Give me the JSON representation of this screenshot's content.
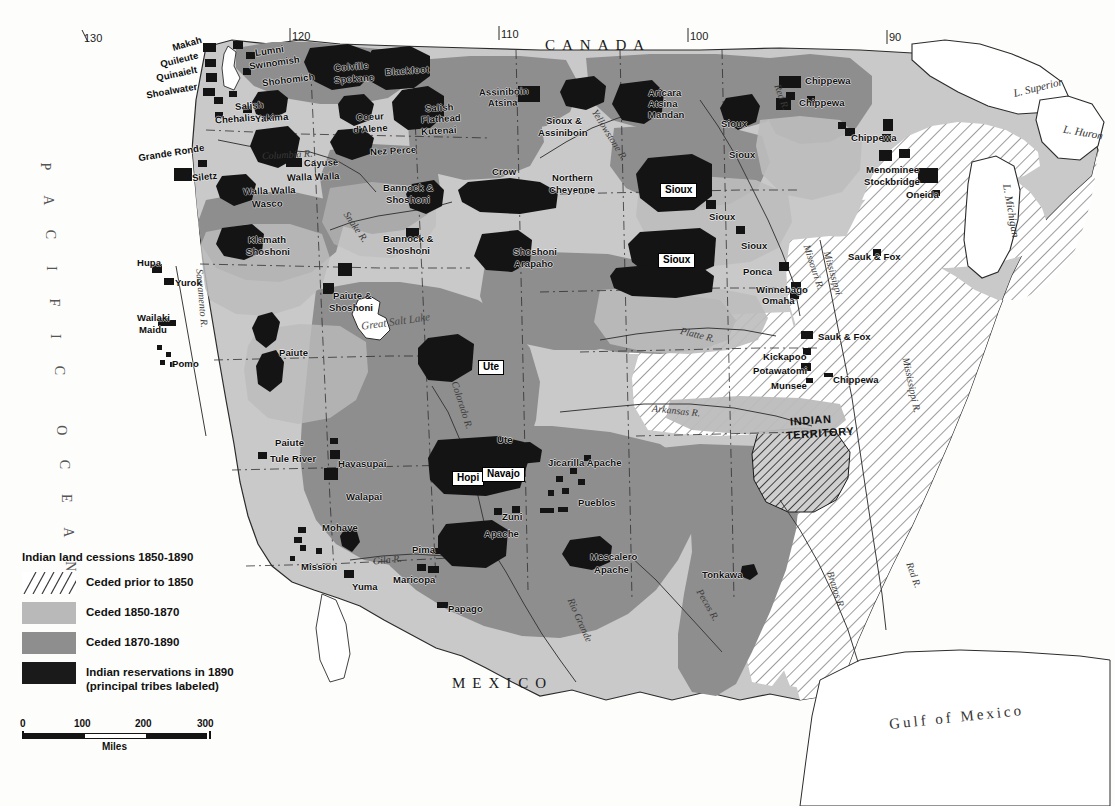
{
  "map": {
    "title": "Indian land cessions 1850-1890",
    "domain": "historical-thematic-map",
    "countries": [
      {
        "name": "CANADA",
        "x": 545,
        "y": 38
      },
      {
        "name": "MEXICO",
        "x": 452,
        "y": 676
      }
    ],
    "oceans": [
      {
        "name": "PACIFIC OCEAN",
        "x": 40,
        "y": 160
      },
      {
        "name": "Gulf of Mexico",
        "x": 889,
        "y": 710
      }
    ],
    "lakes": [
      {
        "name": "L. Superior",
        "x": 1013,
        "y": 82
      },
      {
        "name": "L. Huron",
        "x": 1063,
        "y": 127
      },
      {
        "name": "L. Michigan",
        "x": 984,
        "y": 205
      },
      {
        "name": "Great Salt Lake",
        "x": 361,
        "y": 316
      }
    ],
    "rivers": [
      {
        "name": "Columbia R.",
        "x": 262,
        "y": 150
      },
      {
        "name": "Snake R.",
        "x": 338,
        "y": 222
      },
      {
        "name": "Yellowstone R.",
        "x": 580,
        "y": 130
      },
      {
        "name": "Missouri R.",
        "x": 790,
        "y": 262
      },
      {
        "name": "Red R.",
        "x": 768,
        "y": 92
      },
      {
        "name": "Platte R.",
        "x": 680,
        "y": 330
      },
      {
        "name": "Arkansas R.",
        "x": 652,
        "y": 406
      },
      {
        "name": "Sacramento R.",
        "x": 172,
        "y": 293
      },
      {
        "name": "Colorado R.",
        "x": 437,
        "y": 400
      },
      {
        "name": "Gila R.",
        "x": 373,
        "y": 555
      },
      {
        "name": "Rio Grande",
        "x": 556,
        "y": 615
      },
      {
        "name": "Pecos R.",
        "x": 690,
        "y": 600
      },
      {
        "name": "Brazos R.",
        "x": 816,
        "y": 585
      },
      {
        "name": "Red R.",
        "x": 900,
        "y": 570
      },
      {
        "name": "Mississippi R.",
        "x": 883,
        "y": 380
      },
      {
        "name": "Mississippi",
        "x": 810,
        "y": 268
      }
    ],
    "graticule_top": [
      {
        "label": "130",
        "x": 84,
        "y": 33
      },
      {
        "label": "120",
        "x": 292,
        "y": 31
      },
      {
        "label": "110",
        "x": 501,
        "y": 29
      },
      {
        "label": "100",
        "x": 690,
        "y": 31
      },
      {
        "label": "90",
        "x": 889,
        "y": 32
      }
    ],
    "territory_labels": [
      {
        "line1": "INDIAN",
        "line2": "TERRITORY",
        "x": 790,
        "y": 415
      }
    ],
    "tribes": [
      {
        "name": "Makah",
        "x": 172,
        "y": 39,
        "rot": -16
      },
      {
        "name": "Quileute",
        "x": 160,
        "y": 55,
        "rot": -14
      },
      {
        "name": "Quinaielt",
        "x": 156,
        "y": 69,
        "rot": -12
      },
      {
        "name": "Shoalwater",
        "x": 146,
        "y": 86,
        "rot": -10
      },
      {
        "name": "Lumni",
        "x": 255,
        "y": 46,
        "rot": -8
      },
      {
        "name": "Swinomish",
        "x": 249,
        "y": 58,
        "rot": -8
      },
      {
        "name": "Shohomich",
        "x": 262,
        "y": 75,
        "rot": -7
      },
      {
        "name": "Salish",
        "x": 235,
        "y": 101,
        "rot": -4
      },
      {
        "name": "Chehalis",
        "x": 215,
        "y": 114,
        "rot": -4
      },
      {
        "name": "Yakima",
        "x": 255,
        "y": 113,
        "rot": -4
      },
      {
        "name": "Colville",
        "x": 334,
        "y": 62,
        "rot": -4
      },
      {
        "name": "Spokane",
        "x": 334,
        "y": 74,
        "rot": -4
      },
      {
        "name": "Blackfoot",
        "x": 385,
        "y": 66,
        "rot": -4
      },
      {
        "name": "Coeur",
        "x": 356,
        "y": 112,
        "rot": -3
      },
      {
        "name": "d'Alene",
        "x": 353,
        "y": 124,
        "rot": -3
      },
      {
        "name": "Salish",
        "x": 425,
        "y": 103,
        "rot": -3
      },
      {
        "name": "Flathead",
        "x": 421,
        "y": 114,
        "rot": -3
      },
      {
        "name": "Kutenai",
        "x": 421,
        "y": 126,
        "rot": -3
      },
      {
        "name": "Assiniboin",
        "x": 479,
        "y": 87,
        "rot": -2
      },
      {
        "name": "Atsina",
        "x": 488,
        "y": 98,
        "rot": -2
      },
      {
        "name": "Sioux &",
        "x": 546,
        "y": 116,
        "rot": 0
      },
      {
        "name": "Assiniboin",
        "x": 538,
        "y": 128,
        "rot": 0
      },
      {
        "name": "Aricara",
        "x": 648,
        "y": 88,
        "rot": 0
      },
      {
        "name": "Atsina",
        "x": 648,
        "y": 99,
        "rot": 0
      },
      {
        "name": "Mandan",
        "x": 648,
        "y": 110,
        "rot": 0
      },
      {
        "name": "Chippewa",
        "x": 805,
        "y": 76,
        "rot": 0
      },
      {
        "name": "Chippewa",
        "x": 799,
        "y": 98,
        "rot": 0
      },
      {
        "name": "Chippewa",
        "x": 851,
        "y": 133,
        "rot": 0
      },
      {
        "name": "Menominee",
        "x": 866,
        "y": 165,
        "rot": 0
      },
      {
        "name": "Stockbridge",
        "x": 864,
        "y": 177,
        "rot": 0
      },
      {
        "name": "Oneida",
        "x": 906,
        "y": 190,
        "rot": 0
      },
      {
        "name": "Sioux",
        "x": 721,
        "y": 119,
        "rot": 0
      },
      {
        "name": "Sioux",
        "x": 729,
        "y": 150,
        "rot": 0
      },
      {
        "name": "Sioux",
        "x": 709,
        "y": 212,
        "rot": 0
      },
      {
        "name": "Sioux",
        "x": 741,
        "y": 241,
        "rot": 0
      },
      {
        "name": "Crow",
        "x": 492,
        "y": 167,
        "rot": 0
      },
      {
        "name": "Northern",
        "x": 552,
        "y": 173,
        "rot": 0
      },
      {
        "name": "Cheyenne",
        "x": 549,
        "y": 185,
        "rot": 0
      },
      {
        "name": "Shoshoni",
        "x": 513,
        "y": 247,
        "rot": 0
      },
      {
        "name": "Arapaho",
        "x": 514,
        "y": 259,
        "rot": 0
      },
      {
        "name": "Bannock &",
        "x": 383,
        "y": 183,
        "rot": 0
      },
      {
        "name": "Shoshoni",
        "x": 386,
        "y": 195,
        "rot": 0
      },
      {
        "name": "Bannock &",
        "x": 383,
        "y": 234,
        "rot": 0
      },
      {
        "name": "Shoshoni",
        "x": 386,
        "y": 246,
        "rot": 0
      },
      {
        "name": "Nez Perce",
        "x": 370,
        "y": 146,
        "rot": -3
      },
      {
        "name": "Cayuse",
        "x": 304,
        "y": 158,
        "rot": -2
      },
      {
        "name": "Walla Walla",
        "x": 287,
        "y": 172,
        "rot": -2
      },
      {
        "name": "Walla Walla",
        "x": 243,
        "y": 186,
        "rot": -2
      },
      {
        "name": "Wasco",
        "x": 252,
        "y": 199,
        "rot": -2
      },
      {
        "name": "Siletz",
        "x": 192,
        "y": 172,
        "rot": -6
      },
      {
        "name": "Grande Ronde",
        "x": 138,
        "y": 148,
        "rot": -9
      },
      {
        "name": "Klamath",
        "x": 248,
        "y": 235,
        "rot": 0
      },
      {
        "name": "Shoshoni",
        "x": 246,
        "y": 247,
        "rot": 0
      },
      {
        "name": "Hupa",
        "x": 137,
        "y": 258,
        "rot": 0
      },
      {
        "name": "Yurok",
        "x": 175,
        "y": 278,
        "rot": 0
      },
      {
        "name": "Wailaki",
        "x": 137,
        "y": 313,
        "rot": 0
      },
      {
        "name": "Maidu",
        "x": 139,
        "y": 325,
        "rot": 0
      },
      {
        "name": "Pomo",
        "x": 172,
        "y": 359,
        "rot": 0
      },
      {
        "name": "Paiute &",
        "x": 333,
        "y": 291,
        "rot": 0
      },
      {
        "name": "Shoshoni",
        "x": 329,
        "y": 303,
        "rot": 0
      },
      {
        "name": "Paiute",
        "x": 279,
        "y": 348,
        "rot": 0
      },
      {
        "name": "Paiute",
        "x": 275,
        "y": 438,
        "rot": 0
      },
      {
        "name": "Tule River",
        "x": 270,
        "y": 454,
        "rot": 0
      },
      {
        "name": "Mohave",
        "x": 322,
        "y": 523,
        "rot": 0
      },
      {
        "name": "Mission",
        "x": 301,
        "y": 562,
        "rot": 0
      },
      {
        "name": "Yuma",
        "x": 352,
        "y": 582,
        "rot": 0
      },
      {
        "name": "Walapai",
        "x": 346,
        "y": 492,
        "rot": 0
      },
      {
        "name": "Havasupai",
        "x": 338,
        "y": 459,
        "rot": 0
      },
      {
        "name": "Apache",
        "x": 484,
        "y": 529,
        "rot": 0
      },
      {
        "name": "Pima",
        "x": 412,
        "y": 545,
        "rot": 0
      },
      {
        "name": "Maricopa",
        "x": 393,
        "y": 575,
        "rot": 0
      },
      {
        "name": "Papago",
        "x": 448,
        "y": 604,
        "rot": 0
      },
      {
        "name": "Zuni",
        "x": 502,
        "y": 512,
        "rot": 0
      },
      {
        "name": "Pueblos",
        "x": 578,
        "y": 498,
        "rot": 0
      },
      {
        "name": "Jicarilla Apache",
        "x": 548,
        "y": 458,
        "rot": 0
      },
      {
        "name": "Mescalero",
        "x": 590,
        "y": 552,
        "rot": 0
      },
      {
        "name": "Apache",
        "x": 594,
        "y": 565,
        "rot": 0
      },
      {
        "name": "Ute",
        "x": 497,
        "y": 435,
        "rot": 0
      },
      {
        "name": "Tonkawa",
        "x": 702,
        "y": 570,
        "rot": 0
      },
      {
        "name": "Ponca",
        "x": 743,
        "y": 267,
        "rot": 0
      },
      {
        "name": "Winnebago",
        "x": 756,
        "y": 285,
        "rot": 0
      },
      {
        "name": "Omaha",
        "x": 762,
        "y": 296,
        "rot": 0
      },
      {
        "name": "Sauk & Fox",
        "x": 848,
        "y": 252,
        "rot": 0
      },
      {
        "name": "Sauk & Fox",
        "x": 818,
        "y": 332,
        "rot": 0
      },
      {
        "name": "Kickapoo",
        "x": 763,
        "y": 352,
        "rot": 0
      },
      {
        "name": "Potawatomi",
        "x": 753,
        "y": 366,
        "rot": 0
      },
      {
        "name": "Munsee",
        "x": 771,
        "y": 381,
        "rot": 0
      },
      {
        "name": "Chippewa",
        "x": 833,
        "y": 375,
        "rot": 0
      }
    ],
    "boxed_tribes": [
      {
        "name": "Sioux",
        "x": 660,
        "y": 183
      },
      {
        "name": "Sioux",
        "x": 658,
        "y": 253
      },
      {
        "name": "Ute",
        "x": 478,
        "y": 360
      },
      {
        "name": "Hopi",
        "x": 452,
        "y": 471
      },
      {
        "name": "Navajo",
        "x": 482,
        "y": 467
      }
    ]
  },
  "legend": {
    "title": "Indian land cessions 1850-1890",
    "items": [
      {
        "label": "Ceded prior to 1850",
        "swatch": "hatch",
        "color": "#ffffff"
      },
      {
        "label": "Ceded 1850-1870",
        "swatch": "solid",
        "color": "#b9b9b9"
      },
      {
        "label": "Ceded 1870-1890",
        "swatch": "solid",
        "color": "#8e8e8e"
      },
      {
        "label": "Indian reservations in 1890\n(principal tribes labeled)",
        "swatch": "solid",
        "color": "#1a1a1a"
      }
    ],
    "item_labels": [
      "Ceded prior to 1850",
      "Ceded 1850-1870",
      "Ceded 1870-1890",
      "Indian reservations in 1890",
      "(principal tribes labeled)"
    ]
  },
  "scale": {
    "ticks": [
      "0",
      "100",
      "200",
      "300"
    ],
    "unit": "Miles",
    "max_miles": 300
  },
  "colors": {
    "ceded_1850_1870": "#b9b9b9",
    "ceded_1870_1890": "#8e8e8e",
    "reservation": "#1a1a1a",
    "unceded_base": "#c9c9c9",
    "water": "#ffffff",
    "outline": "#2b2b2b",
    "page": "#fdfdfb"
  }
}
